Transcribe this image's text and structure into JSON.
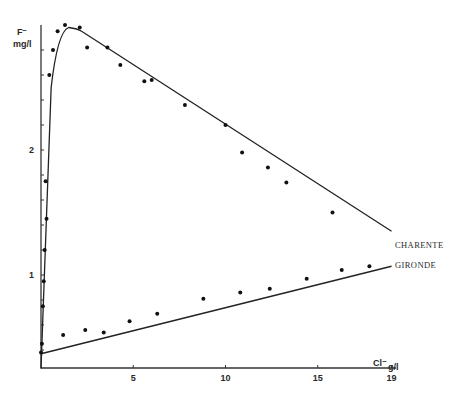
{
  "chart_data": {
    "type": "scatter",
    "title": "",
    "xlabel": "Cl⁻ g/l",
    "ylabel": "F⁻ mg/l",
    "y_label_line1": "F⁻",
    "y_label_line2": "mg/l",
    "x_label_main": "Cl⁻",
    "x_label_unit": "g/l",
    "xlim": [
      0,
      19
    ],
    "ylim": [
      0.25,
      3.0
    ],
    "x_ticks": [
      5,
      10,
      15,
      19
    ],
    "x_tick_labels": [
      "5",
      "10",
      "15",
      "19"
    ],
    "y_ticks": [
      1,
      2
    ],
    "y_tick_labels": [
      "1",
      "2"
    ],
    "y_minor_tick_step": 0.2,
    "grid": false,
    "legend_position": "inline labels at line ends (right)",
    "series": [
      {
        "name": "CHARENTE",
        "points": [
          [
            0.1,
            0.75
          ],
          [
            0.15,
            0.95
          ],
          [
            0.2,
            1.2
          ],
          [
            0.3,
            1.45
          ],
          [
            0.25,
            1.75
          ],
          [
            0.45,
            2.6
          ],
          [
            0.65,
            2.8
          ],
          [
            0.9,
            2.95
          ],
          [
            1.3,
            3.0
          ],
          [
            2.1,
            2.98
          ],
          [
            2.5,
            2.82
          ],
          [
            3.6,
            2.82
          ],
          [
            4.3,
            2.68
          ],
          [
            5.6,
            2.55
          ],
          [
            6.0,
            2.56
          ],
          [
            7.8,
            2.36
          ],
          [
            10.0,
            2.2
          ],
          [
            10.9,
            1.98
          ],
          [
            12.3,
            1.86
          ],
          [
            13.3,
            1.74
          ],
          [
            15.8,
            1.5
          ]
        ],
        "fit_line": [
          [
            0.0,
            0.25
          ],
          [
            0.55,
            2.5
          ],
          [
            0.9,
            2.85
          ],
          [
            1.5,
            2.98
          ],
          [
            2.2,
            2.95
          ],
          [
            19.0,
            1.35
          ]
        ]
      },
      {
        "name": "GIRONDE",
        "points": [
          [
            0.0,
            0.38
          ],
          [
            0.05,
            0.45
          ],
          [
            1.2,
            0.52
          ],
          [
            2.4,
            0.56
          ],
          [
            3.4,
            0.54
          ],
          [
            4.8,
            0.63
          ],
          [
            6.3,
            0.69
          ],
          [
            8.8,
            0.81
          ],
          [
            10.8,
            0.86
          ],
          [
            12.4,
            0.89
          ],
          [
            14.4,
            0.97
          ],
          [
            16.3,
            1.04
          ],
          [
            17.8,
            1.07
          ]
        ],
        "fit_line": [
          [
            0.0,
            0.37
          ],
          [
            19.0,
            1.07
          ]
        ]
      }
    ]
  }
}
